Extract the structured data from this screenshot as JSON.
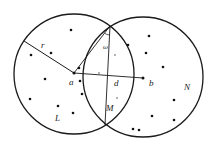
{
  "diagram": {
    "width": 216,
    "height": 151,
    "colors": {
      "stroke": "#1a1a1a",
      "dot": "#111111",
      "faint": "#999999",
      "background": "#ffffff"
    },
    "circles": [
      {
        "name": "L",
        "cx": 74,
        "cy": 74,
        "r": 60
      },
      {
        "name": "N",
        "cx": 143,
        "cy": 77,
        "r": 60
      }
    ],
    "points": {
      "a": {
        "x": 74,
        "y": 73
      },
      "b": {
        "x": 143,
        "y": 78
      },
      "top_intersection": {
        "x": 110,
        "y": 26
      },
      "bottom_intersection": {
        "x": 105,
        "y": 125
      },
      "r_end": {
        "x": 24,
        "y": 41
      }
    },
    "labels": {
      "r": "r",
      "a": "a",
      "d": "d",
      "b": "b",
      "N": "N",
      "L": "L",
      "M": "M",
      "omega": "ω"
    },
    "dots_left": [
      [
        71,
        30
      ],
      [
        51,
        53
      ],
      [
        31,
        55
      ],
      [
        45,
        79
      ],
      [
        30,
        99
      ],
      [
        58,
        106
      ],
      [
        73,
        113
      ],
      [
        82,
        94
      ],
      [
        80,
        81
      ],
      [
        79,
        68
      ]
    ],
    "dots_right": [
      [
        149,
        36
      ],
      [
        128,
        45
      ],
      [
        146,
        53
      ],
      [
        163,
        67
      ],
      [
        174,
        100
      ],
      [
        152,
        116
      ],
      [
        174,
        120
      ],
      [
        133,
        129
      ],
      [
        139,
        130
      ]
    ],
    "dots_faint": [
      [
        115,
        55
      ],
      [
        99,
        73
      ],
      [
        117,
        98
      ]
    ]
  }
}
